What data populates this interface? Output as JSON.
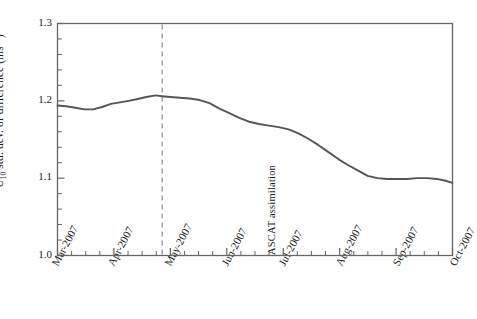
{
  "chart_data": {
    "type": "line",
    "title": "",
    "xlabel": "",
    "ylabel": "U10 std. dev. of difference (ms-1)",
    "ylabel_parts": {
      "prefix": "U",
      "subscript": "10",
      "middle": " std. dev. of difference (ms",
      "superscript": "−1",
      "suffix": ")"
    },
    "ylim": [
      1.0,
      1.3
    ],
    "ytick_labels": [
      "1.3",
      "1.2",
      "1.1",
      "1.0"
    ],
    "ytick_values": [
      1.3,
      1.2,
      1.1,
      1.0
    ],
    "yminor_step": 0.02,
    "grid": false,
    "legend": "none",
    "xtick_labels": [
      "Mar-2007",
      "Apr-2007",
      "May-2007",
      "Jun-2007",
      "Jul-2007",
      "Aug-2007",
      "Sep-2007",
      "Oct-2007"
    ],
    "xlim_labels": [
      "Mar-2007",
      "Oct-2007"
    ],
    "xminor_per_major": 4,
    "line_color": "#555555",
    "annotation": {
      "text": "ASCAT assimilation",
      "x_label": "Jun-2007",
      "x_fraction": 0.265,
      "style": "dashed-vertical-line",
      "color": "#888888"
    },
    "series": [
      {
        "name": "U10 std. dev. of difference",
        "x": [
          0.0,
          0.022,
          0.045,
          0.068,
          0.09,
          0.113,
          0.135,
          0.158,
          0.18,
          0.2,
          0.225,
          0.248,
          0.265,
          0.285,
          0.31,
          0.335,
          0.36,
          0.385,
          0.41,
          0.435,
          0.46,
          0.485,
          0.51,
          0.535,
          0.56,
          0.585,
          0.61,
          0.635,
          0.66,
          0.685,
          0.71,
          0.735,
          0.76,
          0.785,
          0.81,
          0.835,
          0.86,
          0.885,
          0.91,
          0.935,
          0.96,
          0.98,
          1.0
        ],
        "values": [
          1.194,
          1.193,
          1.191,
          1.189,
          1.189,
          1.192,
          1.196,
          1.198,
          1.2,
          1.202,
          1.205,
          1.207,
          1.206,
          1.205,
          1.204,
          1.203,
          1.201,
          1.197,
          1.19,
          1.184,
          1.178,
          1.173,
          1.17,
          1.168,
          1.166,
          1.163,
          1.158,
          1.151,
          1.143,
          1.134,
          1.125,
          1.117,
          1.11,
          1.103,
          1.1,
          1.099,
          1.099,
          1.099,
          1.1,
          1.1,
          1.099,
          1.097,
          1.094
        ]
      }
    ]
  },
  "axes": {
    "frame_color": "#666666",
    "background": "#ffffff"
  }
}
